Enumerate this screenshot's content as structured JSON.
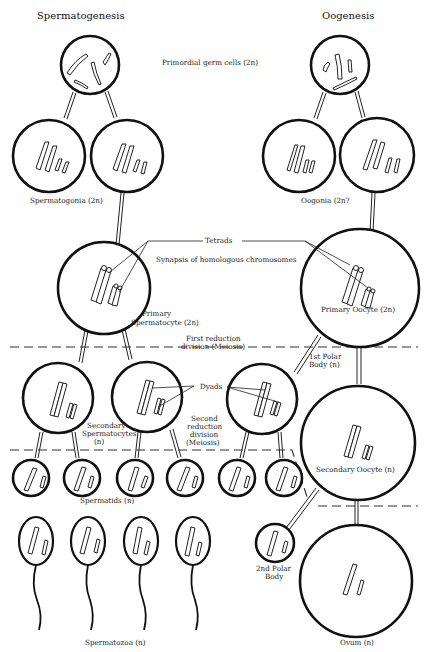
{
  "titles": {
    "left": "Spermatogenesis",
    "right": "Oogenesis"
  },
  "labels": {
    "primordial": "Primordial germ cells (2n)",
    "spermatogonia": "Spermatogonia (2n)",
    "oogonia": "Oogonia (2n?",
    "tetrads": "Tetrads",
    "synapsis": "Synapsis of homologous chromosomes",
    "primary_spermatocyte_1": "Primary",
    "primary_spermatocyte_2": "Spermatocyte (2n)",
    "primary_oocyte": "Primary Oocyte (2n)",
    "first_reduction_1": "First reduction",
    "first_reduction_2": "division (Meiosis)",
    "first_polar_1": "1st Polar",
    "first_polar_2": "Body (n)",
    "dyads": "Dyads",
    "secondary_spermatocytes_1": "Secondary",
    "secondary_spermatocytes_2": "Spermatocytes",
    "secondary_spermatocytes_3": "(n)",
    "second_reduction_1": "Second",
    "second_reduction_2": "reduction",
    "second_reduction_3": "division",
    "second_reduction_4": "(Meiosis)",
    "secondary_oocyte": "Secondary Oocyte (n)",
    "spermatids": "Spermatids (n)",
    "second_polar_1": "2nd Polar",
    "second_polar_2": "Body",
    "spermatozoa": "Spermatozoa (n)",
    "ovum": "Ovum (n)"
  },
  "stages": {
    "spermatogenesis": [
      "Primordial germ cell",
      "Spermatogonia",
      "Primary Spermatocyte",
      "Secondary Spermatocytes",
      "Spermatids",
      "Spermatozoa"
    ],
    "oogenesis": [
      "Primordial germ cell",
      "Oogonia",
      "Primary Oocyte",
      "Secondary Oocyte + 1st Polar Body",
      "Ovum + 2nd Polar Body"
    ]
  },
  "colors": {
    "ink": "#111111",
    "background": "#ffffff"
  }
}
